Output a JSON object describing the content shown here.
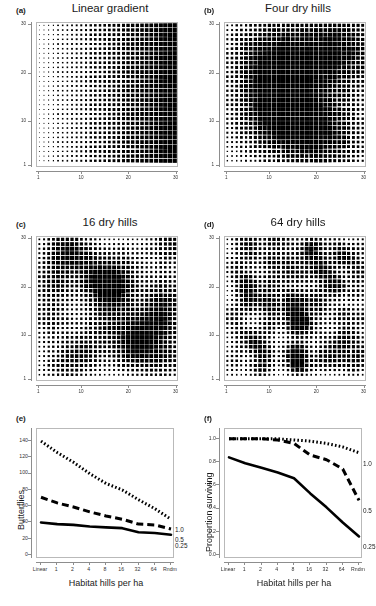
{
  "figure": {
    "panels": [
      {
        "letter": "(a)",
        "title": "Linear gradient",
        "type": "dot-density-map",
        "grid": 30,
        "pattern": "linear",
        "x_ticks": [
          "1",
          "10",
          "20",
          "30"
        ],
        "y_ticks": [
          "1",
          "10",
          "20",
          "30"
        ]
      },
      {
        "letter": "(b)",
        "title": "Four dry hills",
        "type": "dot-density-map",
        "grid": 30,
        "pattern": "hills",
        "hills": 4,
        "x_ticks": [
          "1",
          "10",
          "20",
          "30"
        ],
        "y_ticks": [
          "1",
          "10",
          "20",
          "30"
        ]
      },
      {
        "letter": "(c)",
        "title": "16 dry hills",
        "type": "dot-density-map",
        "grid": 30,
        "pattern": "hills",
        "hills": 16,
        "x_ticks": [
          "1",
          "10",
          "20",
          "30"
        ],
        "y_ticks": [
          "1",
          "10",
          "20",
          "30"
        ]
      },
      {
        "letter": "(d)",
        "title": "64 dry hills",
        "type": "dot-density-map",
        "grid": 30,
        "pattern": "hills",
        "hills": 64,
        "x_ticks": [
          "1",
          "10",
          "20",
          "30"
        ],
        "y_ticks": [
          "1",
          "10",
          "20",
          "30"
        ]
      },
      {
        "letter": "(e)",
        "title": "",
        "type": "line-chart"
      },
      {
        "letter": "(f)",
        "title": "",
        "type": "line-chart"
      }
    ]
  },
  "chart_data": [
    {
      "type": "line",
      "panel": "e",
      "title": "",
      "xlabel": "Habitat hills per ha",
      "ylabel": "Butterflies",
      "categories": [
        "Linear",
        "1",
        "2",
        "4",
        "8",
        "16",
        "32",
        "64",
        "Rndm"
      ],
      "x_tick_labels": [
        "Linear",
        "1",
        "2",
        "4",
        "8",
        "16",
        "32",
        "64",
        "Rndm"
      ],
      "y_tick_labels": [
        "0",
        "20",
        "40",
        "60",
        "80",
        "100",
        "120",
        "140"
      ],
      "ylim": [
        0,
        150
      ],
      "grid": false,
      "legend_position": "right-inline",
      "series": [
        {
          "name": "1.0",
          "style": "dotted",
          "label": "1.0",
          "values": [
            140,
            126,
            114,
            100,
            88,
            80,
            68,
            57,
            44
          ]
        },
        {
          "name": "0.5",
          "style": "dashed",
          "label": "0.5",
          "values": [
            71,
            64,
            59,
            53,
            48,
            44,
            38,
            37,
            32
          ]
        },
        {
          "name": "0.25",
          "style": "solid",
          "label": "0.25",
          "values": [
            40,
            38,
            37,
            35,
            34,
            33,
            28,
            27,
            25
          ]
        }
      ]
    },
    {
      "type": "line",
      "panel": "f",
      "title": "",
      "xlabel": "Habitat hills per ha",
      "ylabel": "Proportion surviving",
      "categories": [
        "Linear",
        "1",
        "2",
        "4",
        "8",
        "16",
        "32",
        "64",
        "Rndm"
      ],
      "x_tick_labels": [
        "Linear",
        "1",
        "2",
        "4",
        "8",
        "16",
        "32",
        "64",
        "Rndm"
      ],
      "y_tick_labels": [
        "0.0",
        "0.2",
        "0.4",
        "0.6",
        "0.8",
        "1.0"
      ],
      "ylim": [
        0.0,
        1.05
      ],
      "grid": false,
      "legend_position": "right-inline",
      "series": [
        {
          "name": "1.0",
          "style": "dotted",
          "label": "1.0",
          "values": [
            1.0,
            1.0,
            1.0,
            1.0,
            0.99,
            0.98,
            0.96,
            0.93,
            0.88
          ]
        },
        {
          "name": "0.5",
          "style": "dashed",
          "label": "0.5",
          "values": [
            1.0,
            1.0,
            1.0,
            0.99,
            0.96,
            0.86,
            0.82,
            0.74,
            0.47
          ]
        },
        {
          "name": "0.25",
          "style": "solid",
          "label": "0.25",
          "values": [
            0.84,
            0.79,
            0.75,
            0.71,
            0.66,
            0.53,
            0.41,
            0.28,
            0.16
          ]
        }
      ]
    }
  ]
}
